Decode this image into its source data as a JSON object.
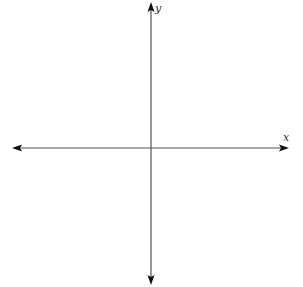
{
  "diagram": {
    "type": "coordinate-axes",
    "x_axis": {
      "label": "x",
      "color": "#444444",
      "arrowheads": [
        "left",
        "right"
      ]
    },
    "y_axis": {
      "label": "y",
      "color": "#444444",
      "arrowheads": [
        "up",
        "down"
      ]
    },
    "background": "#ffffff"
  }
}
